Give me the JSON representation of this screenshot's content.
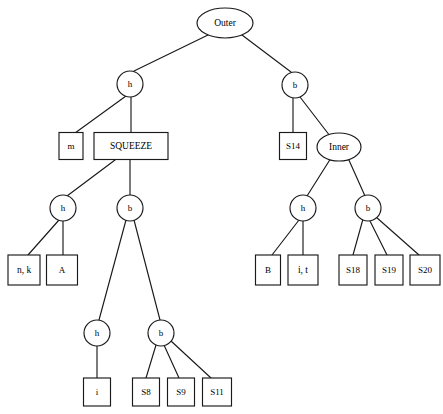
{
  "diagram": {
    "type": "tree",
    "stroke_color": "#1a1a1a",
    "fill_color": "#ffffff",
    "text_color": "#000000",
    "nodes": [
      {
        "id": "n0",
        "label": "Outer",
        "shape": "ellipse",
        "cx": 225,
        "cy": 23,
        "rx": 28,
        "ry": 15
      },
      {
        "id": "n1",
        "label": "h",
        "shape": "circle",
        "cx": 130,
        "cy": 84,
        "rx": 13,
        "ry": 13
      },
      {
        "id": "n2",
        "label": "b",
        "shape": "circle",
        "cx": 295,
        "cy": 85,
        "rx": 13,
        "ry": 13
      },
      {
        "id": "n3",
        "label": "m",
        "shape": "box",
        "cx": 71,
        "cy": 146,
        "w": 24,
        "h": 27
      },
      {
        "id": "n4",
        "label": "SQUEEZE",
        "shape": "box",
        "cx": 131,
        "cy": 146,
        "w": 74,
        "h": 27
      },
      {
        "id": "n5",
        "label": "S14",
        "shape": "box",
        "cx": 293,
        "cy": 146,
        "w": 27,
        "h": 27
      },
      {
        "id": "n6",
        "label": "Inner",
        "shape": "ellipse",
        "cx": 339,
        "cy": 147,
        "rx": 22,
        "ry": 14
      },
      {
        "id": "n7",
        "label": "h",
        "shape": "circle",
        "cx": 63,
        "cy": 208,
        "rx": 13,
        "ry": 13
      },
      {
        "id": "n8",
        "label": "b",
        "shape": "circle",
        "cx": 130,
        "cy": 208,
        "rx": 13,
        "ry": 13
      },
      {
        "id": "n9",
        "label": "h",
        "shape": "circle",
        "cx": 303,
        "cy": 208,
        "rx": 13,
        "ry": 13
      },
      {
        "id": "n10",
        "label": "b",
        "shape": "circle",
        "cx": 368,
        "cy": 208,
        "rx": 13,
        "ry": 13
      },
      {
        "id": "n11",
        "label": "n, k",
        "shape": "box",
        "cx": 24,
        "cy": 270,
        "w": 32,
        "h": 30
      },
      {
        "id": "n12",
        "label": "A",
        "shape": "box",
        "cx": 62,
        "cy": 270,
        "w": 31,
        "h": 30
      },
      {
        "id": "n13",
        "label": "B",
        "shape": "box",
        "cx": 268,
        "cy": 270,
        "w": 25,
        "h": 30
      },
      {
        "id": "n14",
        "label": "i, t",
        "shape": "box",
        "cx": 303,
        "cy": 270,
        "w": 30,
        "h": 30
      },
      {
        "id": "n15",
        "label": "S18",
        "shape": "box",
        "cx": 353,
        "cy": 270,
        "w": 28,
        "h": 30
      },
      {
        "id": "n16",
        "label": "S19",
        "shape": "box",
        "cx": 389,
        "cy": 270,
        "w": 28,
        "h": 30
      },
      {
        "id": "n17",
        "label": "S20",
        "shape": "box",
        "cx": 425,
        "cy": 270,
        "w": 30,
        "h": 30
      },
      {
        "id": "n18",
        "label": "h",
        "shape": "circle",
        "cx": 97,
        "cy": 333,
        "rx": 13,
        "ry": 13
      },
      {
        "id": "n19",
        "label": "b",
        "shape": "circle",
        "cx": 161,
        "cy": 333,
        "rx": 13,
        "ry": 13
      },
      {
        "id": "n20",
        "label": "i",
        "shape": "box",
        "cx": 97,
        "cy": 392,
        "w": 27,
        "h": 28
      },
      {
        "id": "n21",
        "label": "S8",
        "shape": "box",
        "cx": 146,
        "cy": 392,
        "w": 27,
        "h": 28
      },
      {
        "id": "n22",
        "label": "S9",
        "shape": "box",
        "cx": 181,
        "cy": 392,
        "w": 27,
        "h": 28
      },
      {
        "id": "n23",
        "label": "S11",
        "shape": "box",
        "cx": 217,
        "cy": 392,
        "w": 29,
        "h": 28
      }
    ],
    "edges": [
      {
        "from": "n0",
        "to": "n1",
        "x1": 208,
        "y1": 35,
        "x2": 134,
        "y2": 71
      },
      {
        "from": "n0",
        "to": "n2",
        "x1": 242,
        "y1": 35,
        "x2": 291,
        "y2": 72
      },
      {
        "from": "n1",
        "to": "n3",
        "x1": 126,
        "y1": 96,
        "x2": 75,
        "y2": 133
      },
      {
        "from": "n1",
        "to": "n4",
        "x1": 131,
        "y1": 97,
        "x2": 131,
        "y2": 133
      },
      {
        "from": "n2",
        "to": "n5",
        "x1": 293,
        "y1": 98,
        "x2": 293,
        "y2": 133
      },
      {
        "from": "n2",
        "to": "n6",
        "x1": 300,
        "y1": 97,
        "x2": 330,
        "y2": 136
      },
      {
        "from": "n4",
        "to": "n7",
        "x1": 115,
        "y1": 160,
        "x2": 67,
        "y2": 196
      },
      {
        "from": "n4",
        "to": "n8",
        "x1": 130,
        "y1": 160,
        "x2": 130,
        "y2": 195
      },
      {
        "from": "n6",
        "to": "n9",
        "x1": 331,
        "y1": 158,
        "x2": 307,
        "y2": 196
      },
      {
        "from": "n6",
        "to": "n10",
        "x1": 348,
        "y1": 158,
        "x2": 365,
        "y2": 196
      },
      {
        "from": "n7",
        "to": "n11",
        "x1": 59,
        "y1": 220,
        "x2": 28,
        "y2": 255
      },
      {
        "from": "n7",
        "to": "n12",
        "x1": 63,
        "y1": 221,
        "x2": 63,
        "y2": 255
      },
      {
        "from": "n9",
        "to": "n13",
        "x1": 299,
        "y1": 220,
        "x2": 272,
        "y2": 255
      },
      {
        "from": "n9",
        "to": "n14",
        "x1": 303,
        "y1": 221,
        "x2": 303,
        "y2": 255
      },
      {
        "from": "n10",
        "to": "n15",
        "x1": 363,
        "y1": 219,
        "x2": 353,
        "y2": 255
      },
      {
        "from": "n10",
        "to": "n16",
        "x1": 370,
        "y1": 221,
        "x2": 387,
        "y2": 255
      },
      {
        "from": "n10",
        "to": "n17",
        "x1": 376,
        "y1": 217,
        "x2": 419,
        "y2": 255
      },
      {
        "from": "n8",
        "to": "n18",
        "x1": 126,
        "y1": 220,
        "x2": 99,
        "y2": 320
      },
      {
        "from": "n8",
        "to": "n19",
        "x1": 134,
        "y1": 220,
        "x2": 160,
        "y2": 320
      },
      {
        "from": "n18",
        "to": "n20",
        "x1": 97,
        "y1": 346,
        "x2": 97,
        "y2": 378
      },
      {
        "from": "n19",
        "to": "n21",
        "x1": 156,
        "y1": 345,
        "x2": 146,
        "y2": 378
      },
      {
        "from": "n19",
        "to": "n22",
        "x1": 164,
        "y1": 345,
        "x2": 179,
        "y2": 378
      },
      {
        "from": "n19",
        "to": "n23",
        "x1": 171,
        "y1": 341,
        "x2": 211,
        "y2": 378
      }
    ]
  }
}
